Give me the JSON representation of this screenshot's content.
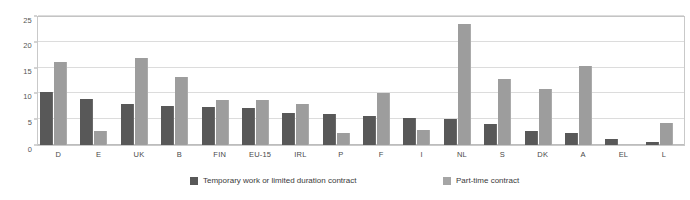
{
  "chart_data": {
    "type": "bar",
    "title": "",
    "subtitle": "",
    "xlabel": "",
    "ylabel": "",
    "ylim": [
      0,
      25
    ],
    "yticks": [
      0,
      5,
      10,
      15,
      20,
      25
    ],
    "ytick_labels": [
      "0",
      "5",
      "10",
      "15",
      "20",
      "25"
    ],
    "grid": true,
    "grid_axis": "y",
    "legend_position": "bottom",
    "categories": [
      "D",
      "E",
      "UK",
      "B",
      "FIN",
      "EU-15",
      "IRL",
      "P",
      "F",
      "I",
      "NL",
      "S",
      "DK",
      "A",
      "EL",
      "L"
    ],
    "series": [
      {
        "name": "Temporary work or limited duration contract",
        "color": "#585858",
        "values": [
          10.3,
          8.9,
          7.9,
          7.5,
          7.3,
          7.1,
          6.2,
          6.1,
          5.6,
          5.3,
          5.0,
          4.1,
          2.8,
          2.4,
          1.2,
          0.6
        ]
      },
      {
        "name": "Part-time contract",
        "color": "#9d9d9d",
        "values": [
          16.0,
          2.8,
          16.9,
          13.1,
          8.7,
          8.8,
          7.9,
          2.3,
          10.0,
          3.0,
          23.4,
          12.8,
          10.8,
          15.3,
          0.0,
          4.2
        ]
      }
    ]
  },
  "legend": {
    "items": [
      {
        "label": "Temporary work or limited duration contract",
        "color": "#585858"
      },
      {
        "label": "Part-time contract",
        "color": "#a5a5a5"
      }
    ]
  }
}
